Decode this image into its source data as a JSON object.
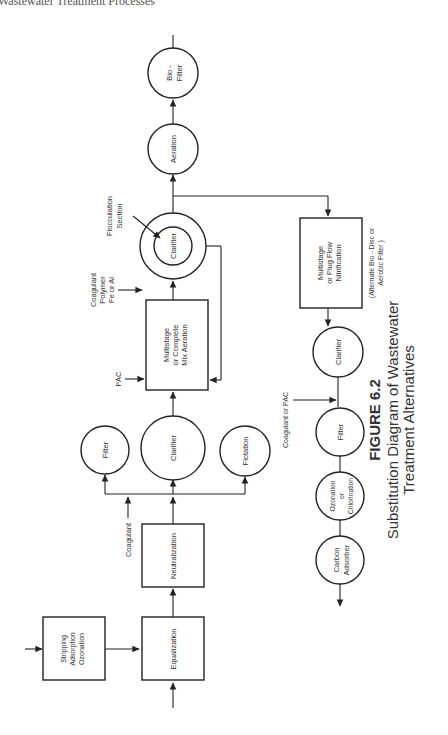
{
  "header": {
    "running_title": "Wastewater Treatment Processes"
  },
  "figure": {
    "number": "FIGURE 6.2",
    "caption_line1": "Substitution Diagram of Wastewater",
    "caption_line2": "Treatment Alternatives",
    "orientation": "rotated 90° counter-clockwise"
  },
  "nodes": {
    "stripping": {
      "shape": "box",
      "lines": [
        "Stripping",
        "Adsorption",
        "Ozonation"
      ]
    },
    "equalization": {
      "shape": "box",
      "lines": [
        "Equalization"
      ]
    },
    "neutralization": {
      "shape": "box",
      "lines": [
        "Neutralization"
      ]
    },
    "filter1": {
      "shape": "circle",
      "lines": [
        "Filter"
      ]
    },
    "clarifier1": {
      "shape": "circle",
      "lines": [
        "Clarifier"
      ]
    },
    "flotation": {
      "shape": "circle",
      "lines": [
        "Flotation"
      ]
    },
    "aeration_mix": {
      "shape": "box",
      "lines": [
        "Multistage",
        "or Complete",
        "Mix Aeration"
      ]
    },
    "clarifier2": {
      "shape": "double-circle",
      "lines": [
        "Clarifier"
      ]
    },
    "aeration": {
      "shape": "circle",
      "lines": [
        "Aeration"
      ]
    },
    "biofilter": {
      "shape": "circle",
      "lines": [
        "Bio -",
        "Filter"
      ]
    },
    "nitrification": {
      "shape": "box",
      "lines": [
        "Multistage",
        "or Plug Flow",
        "Nitrification"
      ]
    },
    "clarifier3": {
      "shape": "circle",
      "lines": [
        "Clarifier"
      ]
    },
    "filter2": {
      "shape": "circle",
      "lines": [
        "Filter"
      ]
    },
    "ozonation": {
      "shape": "circle",
      "lines": [
        "Ozonation",
        "or",
        "Chlorination"
      ]
    },
    "carbon": {
      "shape": "circle",
      "lines": [
        "Carbon",
        "Adsorber"
      ]
    }
  },
  "labels": {
    "coagulant": "Coagulant",
    "pac": "PAC",
    "coag_polymer": [
      "Coagulant",
      "Polymer",
      "Fe or Al"
    ],
    "flocculation": [
      "Flocculation",
      "Section"
    ],
    "alternate": [
      "(Alternate Bio - Disc or",
      "Aerobic Filter )"
    ],
    "coag_or_pac": "Coagulant or PAC"
  }
}
